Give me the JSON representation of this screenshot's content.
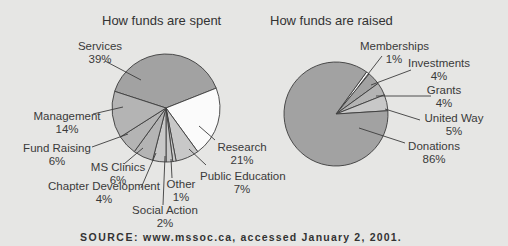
{
  "chart_data": [
    {
      "type": "pie",
      "title": "How funds are spent",
      "categories": [
        "Services",
        "Research",
        "Public Education",
        "Other",
        "Social Action",
        "Chapter Development",
        "MS Clinics",
        "Fund Raising",
        "Management"
      ],
      "values": [
        39,
        21,
        7,
        1,
        2,
        4,
        6,
        6,
        14
      ],
      "labels": [
        {
          "name": "Services",
          "pct": "39%"
        },
        {
          "name": "Research",
          "pct": "21%"
        },
        {
          "name": "Public Education",
          "pct": "7%"
        },
        {
          "name": "Other",
          "pct": "1%"
        },
        {
          "name": "Social Action",
          "pct": "2%"
        },
        {
          "name": "Chapter Development",
          "pct": "4%"
        },
        {
          "name": "MS Clinics",
          "pct": "6%"
        },
        {
          "name": "Fund Raising",
          "pct": "6%"
        },
        {
          "name": "Management",
          "pct": "14%"
        }
      ],
      "unit": "%"
    },
    {
      "type": "pie",
      "title": "How funds are raised",
      "categories": [
        "Memberships",
        "Investments",
        "Grants",
        "United Way",
        "Donations"
      ],
      "values": [
        1,
        4,
        4,
        5,
        86
      ],
      "labels": [
        {
          "name": "Memberships",
          "pct": "1%"
        },
        {
          "name": "Investments",
          "pct": "4%"
        },
        {
          "name": "Grants",
          "pct": "4%"
        },
        {
          "name": "United Way",
          "pct": "5%"
        },
        {
          "name": "Donations",
          "pct": "86%"
        }
      ],
      "unit": "%"
    }
  ],
  "source": {
    "prefix": "SOURCE:",
    "text": "www.mssoc.ca, accessed January 2, 2001."
  },
  "colors": {
    "background": "#e6e6e4",
    "dark_slice": "#a2a2a2",
    "mid_slice": "#b4b4b4",
    "light_slice": "#c8c8c8",
    "white_slice": "#fbfbfb",
    "outline": "#3c3c3c"
  }
}
